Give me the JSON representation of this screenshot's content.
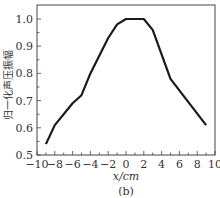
{
  "chart_data": {
    "type": "line",
    "title": "",
    "caption": "(b)",
    "xlabel": "x/cm",
    "ylabel": "归一化声压振幅",
    "xlim": [
      -10,
      10
    ],
    "ylim": [
      0.5,
      1.05
    ],
    "x_ticks": [
      -10,
      -8,
      -6,
      -4,
      -2,
      0,
      2,
      4,
      6,
      8,
      10
    ],
    "x_tick_labels": [
      "−10",
      "−8",
      "−6",
      "−4",
      "−2",
      "0",
      "2",
      "4",
      "6",
      "8",
      "10"
    ],
    "y_ticks": [
      0.5,
      0.6,
      0.7,
      0.8,
      0.9,
      1.0
    ],
    "y_tick_labels": [
      "0.5",
      "0.6",
      "0.7",
      "0.8",
      "0.9",
      "1.0"
    ],
    "grid": false,
    "legend": null,
    "series": [
      {
        "name": "归一化声压振幅",
        "x": [
          -9,
          -8,
          -6,
          -5,
          -4,
          -2,
          -1,
          0,
          2,
          3,
          5,
          9
        ],
        "values": [
          0.54,
          0.61,
          0.69,
          0.72,
          0.8,
          0.93,
          0.98,
          1.0,
          1.0,
          0.96,
          0.78,
          0.61
        ]
      }
    ]
  }
}
